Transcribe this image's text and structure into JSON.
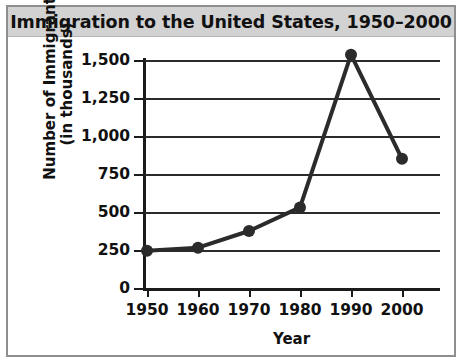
{
  "title": "Immigration to the United States, 1950–2000",
  "chart_data": {
    "type": "line",
    "title": "Immigration to the United States, 1950–2000",
    "xlabel": "Year",
    "ylabel": "Number of Immigrants (in thousands)",
    "ylabel_line1": "Number of Immigrants",
    "ylabel_line2": "(in thousands)",
    "categories": [
      1950,
      1960,
      1970,
      1980,
      1990,
      2000
    ],
    "x_tick_labels": [
      "1950",
      "1960",
      "1970",
      "1980",
      "1990",
      "2000"
    ],
    "values": [
      245,
      265,
      375,
      530,
      1535,
      850
    ],
    "y_tick_values": [
      0,
      250,
      500,
      750,
      1000,
      1250,
      1500
    ],
    "y_tick_labels": [
      "0",
      "250",
      "500",
      "750",
      "1,000",
      "1,250",
      "1,500"
    ],
    "ylim": [
      0,
      1500
    ],
    "xlim": [
      1950,
      2000
    ],
    "grid": true,
    "legend": false,
    "series_color": "#2b2b2b",
    "marker": "circle",
    "units": "thousands of immigrants"
  },
  "style": {
    "frame_border_color": "#8e8e8e",
    "title_bar_background": "#d2d2d2",
    "plot_background": "#ffffff",
    "axis_color": "#1b1b1b",
    "line_color": "#2b2b2b"
  }
}
